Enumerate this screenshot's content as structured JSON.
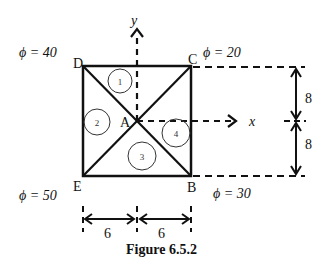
{
  "figure": {
    "caption": "Figure 6.5.2",
    "nodes": {
      "D": {
        "label": "D",
        "phi_label": "ϕ = 40"
      },
      "C": {
        "label": "C",
        "phi_label": "ϕ = 20"
      },
      "E": {
        "label": "E",
        "phi_label": "ϕ = 50"
      },
      "B": {
        "label": "B",
        "phi_label": "ϕ = 30"
      },
      "A": {
        "label": "A"
      }
    },
    "regions": [
      "1",
      "2",
      "3",
      "4"
    ],
    "axes": {
      "x": "x",
      "y": "y"
    },
    "dimensions": {
      "vertical_top": "8",
      "vertical_bottom": "8",
      "horizontal_left": "6",
      "horizontal_right": "6"
    }
  }
}
